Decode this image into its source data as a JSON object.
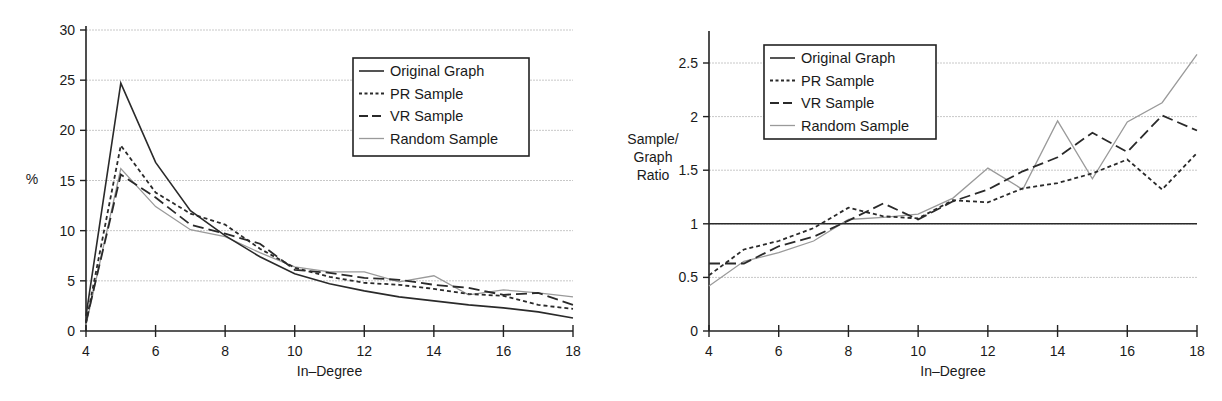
{
  "chart_data": [
    {
      "type": "line",
      "title": "",
      "xlabel": "In–Degree",
      "ylabel": "%",
      "xlim": [
        4,
        18
      ],
      "ylim": [
        0,
        30
      ],
      "x_ticks": [
        4,
        6,
        8,
        10,
        12,
        14,
        16,
        18
      ],
      "y_ticks": [
        0,
        5,
        10,
        15,
        20,
        25,
        30
      ],
      "grid": "horizontal",
      "legend_position": "upper right",
      "x": [
        4,
        5,
        6,
        7,
        8,
        9,
        10,
        11,
        12,
        13,
        14,
        15,
        16,
        17,
        18
      ],
      "series": [
        {
          "name": "Original Graph",
          "style": "solid-dark",
          "values": [
            1.5,
            24.7,
            16.8,
            12.0,
            9.5,
            7.4,
            5.7,
            4.7,
            4.0,
            3.4,
            3.0,
            2.6,
            2.3,
            1.9,
            1.3
          ]
        },
        {
          "name": "PR Sample",
          "style": "short-dash",
          "values": [
            0.8,
            18.5,
            13.8,
            11.7,
            10.6,
            8.2,
            6.3,
            5.4,
            4.8,
            4.6,
            4.2,
            3.7,
            3.5,
            2.6,
            2.2
          ]
        },
        {
          "name": "VR Sample",
          "style": "long-dash",
          "values": [
            0.9,
            15.6,
            13.3,
            10.6,
            9.7,
            8.7,
            6.1,
            5.8,
            5.3,
            5.1,
            4.6,
            4.3,
            3.6,
            3.8,
            2.6
          ]
        },
        {
          "name": "Random Sample",
          "style": "solid-gray",
          "values": [
            0.6,
            16.2,
            12.4,
            10.1,
            9.4,
            7.8,
            6.4,
            5.9,
            5.9,
            4.9,
            5.5,
            3.6,
            4.1,
            3.8,
            3.4
          ]
        }
      ]
    },
    {
      "type": "line",
      "title": "",
      "xlabel": "In–Degree",
      "ylabel": "Sample/\nGraph\nRatio",
      "xlim": [
        4,
        18
      ],
      "ylim": [
        0,
        2.75
      ],
      "x_ticks": [
        4,
        6,
        8,
        10,
        12,
        14,
        16,
        18
      ],
      "y_ticks": [
        0,
        0.5,
        1,
        1.5,
        2,
        2.5
      ],
      "grid": "horizontal",
      "legend_position": "upper left",
      "x": [
        4,
        5,
        6,
        7,
        8,
        9,
        10,
        11,
        12,
        13,
        14,
        15,
        16,
        17,
        18
      ],
      "series": [
        {
          "name": "Original Graph",
          "style": "solid-dark",
          "values": [
            1,
            1,
            1,
            1,
            1,
            1,
            1,
            1,
            1,
            1,
            1,
            1,
            1,
            1,
            1
          ]
        },
        {
          "name": "PR Sample",
          "style": "short-dash",
          "values": [
            0.52,
            0.76,
            0.84,
            0.96,
            1.15,
            1.07,
            1.05,
            1.22,
            1.2,
            1.33,
            1.38,
            1.47,
            1.6,
            1.32,
            1.66
          ]
        },
        {
          "name": "VR Sample",
          "style": "long-dash",
          "values": [
            0.63,
            0.63,
            0.79,
            0.88,
            1.03,
            1.19,
            1.04,
            1.21,
            1.32,
            1.49,
            1.62,
            1.85,
            1.67,
            2.01,
            1.87
          ]
        },
        {
          "name": "Random Sample",
          "style": "solid-gray",
          "values": [
            0.42,
            0.65,
            0.73,
            0.84,
            1.04,
            1.06,
            1.09,
            1.24,
            1.52,
            1.32,
            1.96,
            1.42,
            1.95,
            2.13,
            2.58
          ]
        }
      ]
    }
  ],
  "charts": {
    "left": {
      "ylabel": "%",
      "xlabel": "In–Degree",
      "legend": [
        "Original Graph",
        "PR Sample",
        "VR Sample",
        "Random Sample"
      ]
    },
    "right": {
      "ylabel_lines": [
        "Sample/",
        "Graph",
        "Ratio"
      ],
      "xlabel": "In–Degree",
      "legend": [
        "Original Graph",
        "PR Sample",
        "VR Sample",
        "Random Sample"
      ]
    }
  },
  "styles": {
    "solid-dark": {
      "color": "#2a2a2a",
      "width": 1.6,
      "dash": ""
    },
    "short-dash": {
      "color": "#2a2a2a",
      "width": 1.8,
      "dash": "4,3"
    },
    "long-dash": {
      "color": "#2a2a2a",
      "width": 1.8,
      "dash": "11,5"
    },
    "solid-gray": {
      "color": "#9a9a9a",
      "width": 1.3,
      "dash": ""
    },
    "grid": {
      "color": "#c8c8c8"
    },
    "axis": {
      "color": "#222222"
    }
  }
}
